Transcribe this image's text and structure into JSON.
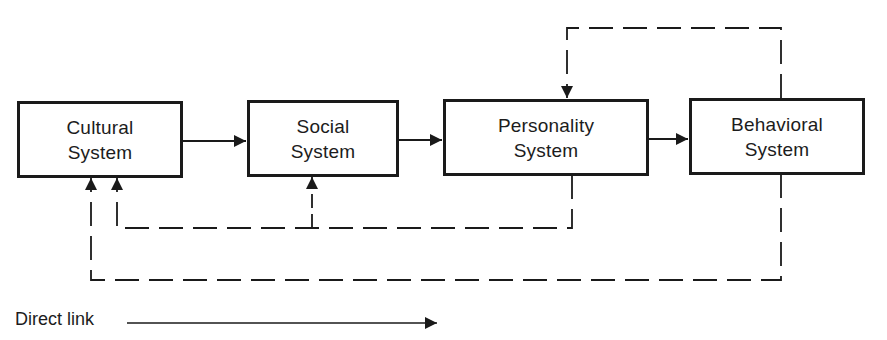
{
  "diagram": {
    "nodes": [
      {
        "id": "cultural",
        "line1": "Cultural",
        "line2": "System"
      },
      {
        "id": "social",
        "line1": "Social",
        "line2": "System"
      },
      {
        "id": "personality",
        "line1": "Personality",
        "line2": "System"
      },
      {
        "id": "behavioral",
        "line1": "Behavioral",
        "line2": "System"
      }
    ],
    "edges": [
      {
        "from": "cultural",
        "to": "social",
        "style": "solid"
      },
      {
        "from": "social",
        "to": "personality",
        "style": "solid"
      },
      {
        "from": "personality",
        "to": "behavioral",
        "style": "solid"
      },
      {
        "from": "behavioral",
        "to": "personality",
        "style": "dashed"
      },
      {
        "from": "personality",
        "to": "social",
        "style": "dashed"
      },
      {
        "from": "personality",
        "to": "cultural",
        "style": "dashed"
      },
      {
        "from": "behavioral",
        "to": "cultural",
        "style": "dashed"
      }
    ],
    "legend": {
      "direct_link_label": "Direct link"
    },
    "colors": {
      "ink": "#1a1a1a",
      "background": "#ffffff"
    }
  }
}
